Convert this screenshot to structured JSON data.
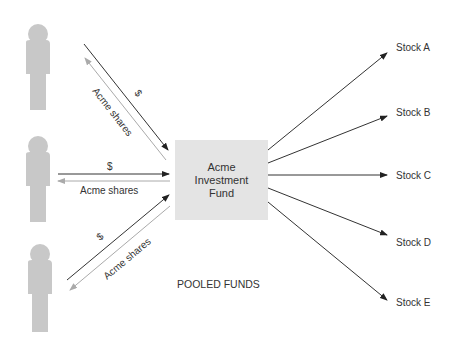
{
  "fund": {
    "line1": "Acme",
    "line2": "Investment",
    "line3": "Fund"
  },
  "caption": "POOLED FUNDS",
  "investors": [
    {
      "money_label": "$",
      "shares_label": "Acme shares"
    },
    {
      "money_label": "$",
      "shares_label": "Acme shares"
    },
    {
      "money_label": "$",
      "shares_label": "Acme shares"
    }
  ],
  "stocks": [
    {
      "label": "Stock A"
    },
    {
      "label": "Stock B"
    },
    {
      "label": "Stock C"
    },
    {
      "label": "Stock D"
    },
    {
      "label": "Stock E"
    }
  ],
  "colors": {
    "person": "#c8c8c8",
    "fund_box": "#e4e4e4",
    "money_arrow": "#333333",
    "shares_arrow": "#aaaaaa"
  }
}
